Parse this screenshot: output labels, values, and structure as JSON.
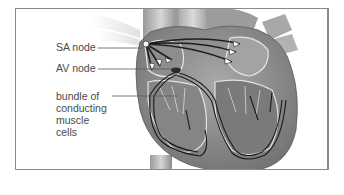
{
  "figure": {
    "labels": {
      "sa_node": "SA node",
      "av_node": "AV node",
      "bundle_line1": "bundle of",
      "bundle_line2": "conducting",
      "bundle_line3": "muscle",
      "bundle_line4": "cells"
    }
  }
}
